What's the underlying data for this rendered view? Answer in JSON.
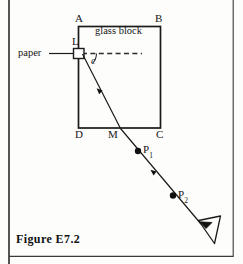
{
  "figure": {
    "caption": "Figure E7.2",
    "block_label": "glass block",
    "paper_label": "paper",
    "angle_label": "c",
    "corners": {
      "A": "A",
      "B": "B",
      "C": "C",
      "D": "D",
      "M": "M",
      "L": "L"
    },
    "pin_points": [
      {
        "label": "P",
        "sub": "1"
      },
      {
        "label": "P",
        "sub": "2"
      }
    ],
    "eye_symbol": "eye-icon",
    "colors": {
      "ink": "#161616",
      "rule": "#2a2a2a",
      "paper": "#fdfdfc"
    }
  }
}
